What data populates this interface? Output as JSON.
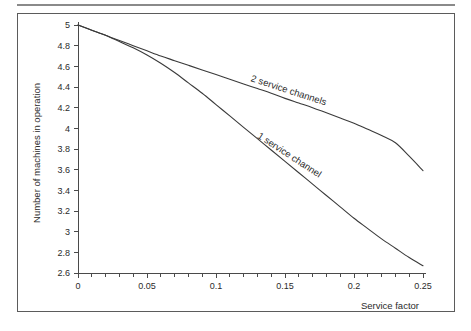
{
  "figure": {
    "background_color": "#ffffff",
    "frame_color": "#5b5b5b",
    "rule_color": "#8a8a8a",
    "line_color": "#3a3a3a"
  },
  "chart_data": {
    "type": "line",
    "title": "",
    "subtitle": "",
    "xlabel": "Service factor",
    "ylabel": "Number of machines in operation",
    "xlim": [
      0,
      0.25
    ],
    "ylim": [
      2.6,
      5.0
    ],
    "grid": false,
    "legend_position": "inline-curve-labels",
    "x_ticks": [
      0,
      0.05,
      0.1,
      0.15,
      0.2,
      0.25
    ],
    "x_tick_labels": [
      "0",
      "0.05",
      "0.1",
      "0.15",
      "0.2",
      "0.25"
    ],
    "x_minor_tick_step": 0.01,
    "y_ticks": [
      2.6,
      2.8,
      3.0,
      3.2,
      3.4,
      3.6,
      3.8,
      4.0,
      4.2,
      4.4,
      4.6,
      4.8,
      5.0
    ],
    "y_tick_labels": [
      "2.6",
      "2.8",
      "3",
      "3.2",
      "3.4",
      "3.6",
      "3.8",
      "4",
      "4.2",
      "4.4",
      "4.6",
      "4.8",
      "5"
    ],
    "x": [
      0,
      0.01,
      0.02,
      0.025,
      0.03,
      0.04,
      0.05,
      0.06,
      0.07,
      0.08,
      0.09,
      0.1,
      0.11,
      0.12,
      0.13,
      0.14,
      0.15,
      0.16,
      0.17,
      0.18,
      0.19,
      0.2,
      0.21,
      0.22,
      0.23,
      0.24,
      0.25
    ],
    "series": [
      {
        "name": "2 service channels",
        "label": "2 service channels",
        "label_rotation_deg": 18,
        "values": [
          5.0,
          4.95,
          4.9,
          4.875,
          4.85,
          4.8,
          4.75,
          4.7,
          4.655,
          4.61,
          4.565,
          4.52,
          4.475,
          4.43,
          4.385,
          4.34,
          4.29,
          4.245,
          4.2,
          4.15,
          4.1,
          4.05,
          3.99,
          3.93,
          3.86,
          3.73,
          3.59
        ]
      },
      {
        "name": "1 service channel",
        "label": "1 service channel",
        "label_rotation_deg": 33,
        "values": [
          5.0,
          4.95,
          4.9,
          4.87,
          4.84,
          4.78,
          4.71,
          4.63,
          4.54,
          4.44,
          4.34,
          4.23,
          4.12,
          4.01,
          3.9,
          3.79,
          3.68,
          3.57,
          3.46,
          3.35,
          3.24,
          3.13,
          3.03,
          2.93,
          2.84,
          2.75,
          2.67
        ]
      }
    ]
  }
}
